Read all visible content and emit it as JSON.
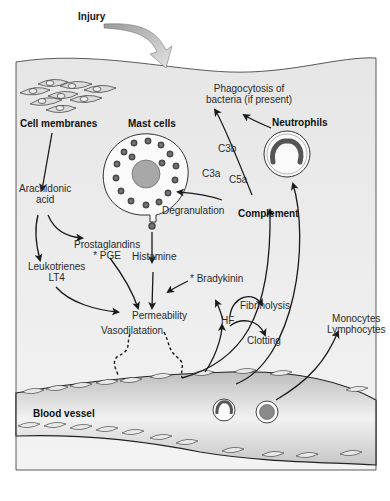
{
  "diagram": {
    "title_label": "Injury",
    "nodes": {
      "cell_membranes": "Cell membranes",
      "mast_cells": "Mast cells",
      "neutrophils": "Neutrophils",
      "phagocytosis_line1": "Phagocytosis of",
      "phagocytosis_line2": "bacteria (if present)",
      "arachidonic_line1": "Arachidonic",
      "arachidonic_line2": "acid",
      "leukotrienes_line1": "Leukotrienes",
      "leukotrienes_line2": "LT4",
      "prostaglandins_line1": "Prostaglandins",
      "prostaglandins_line2": "* PGE",
      "degranulation": "Degranulation",
      "histamine": "Histamine",
      "complement": "Complement",
      "c3a": "C3a",
      "c5a": "C5a",
      "c3b": "C3b",
      "bradykinin": "* Bradykinin",
      "permeability": "Permeability",
      "vasodilatation": "Vasodilatation",
      "hf": "HF",
      "fibrinolysis": "Fibrinolysis",
      "clotting": "Clotting",
      "monocytes": "Monocytes",
      "lymphocytes": "Lymphocytes",
      "blood_vessel": "Blood vessel"
    },
    "colors": {
      "tissue": "#ececec",
      "vessel": "#d6d6d6",
      "arrow": "#1a1a1a",
      "text": "#2a2a2a"
    }
  }
}
